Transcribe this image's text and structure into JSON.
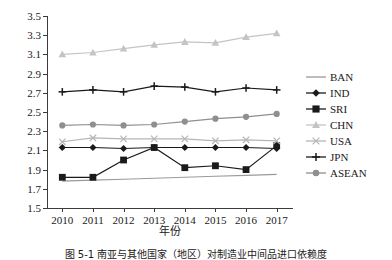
{
  "chart_data": {
    "type": "line",
    "title": "",
    "xlabel": "年份",
    "ylabel": "",
    "categories": [
      "2010",
      "2011",
      "2012",
      "2013",
      "2014",
      "2015",
      "2016",
      "2017"
    ],
    "x": [
      2010,
      2011,
      2012,
      2013,
      2014,
      2015,
      2016,
      2017
    ],
    "ylim": [
      1.5,
      3.5
    ],
    "yticks": [
      "1.5",
      "1.7",
      "1.9",
      "2.1",
      "2.3",
      "2.5",
      "2.7",
      "2.9",
      "3.1",
      "3.3",
      "3.5"
    ],
    "ytick_values": [
      1.5,
      1.7,
      1.9,
      2.1,
      2.3,
      2.5,
      2.7,
      2.9,
      3.1,
      3.3,
      3.5
    ],
    "grid": false,
    "legend_position": "right",
    "series": [
      {
        "name": "BAN",
        "marker": "none",
        "color": "#9a9a9a",
        "values": [
          1.78,
          1.79,
          1.8,
          1.81,
          1.82,
          1.83,
          1.84,
          1.85
        ]
      },
      {
        "name": "IND",
        "marker": "diamond",
        "color": "#1a1a1a",
        "values": [
          2.13,
          2.13,
          2.12,
          2.13,
          2.13,
          2.13,
          2.13,
          2.12
        ]
      },
      {
        "name": "SRI",
        "marker": "square",
        "color": "#1a1a1a",
        "values": [
          1.82,
          1.82,
          2.0,
          2.13,
          1.92,
          1.94,
          1.9,
          2.15
        ]
      },
      {
        "name": "CHN",
        "marker": "triangle",
        "color": "#c4c4c4",
        "values": [
          3.1,
          3.12,
          3.16,
          3.2,
          3.23,
          3.22,
          3.28,
          3.32
        ]
      },
      {
        "name": "USA",
        "marker": "cross-x",
        "color": "#b5b5b5",
        "values": [
          2.19,
          2.23,
          2.22,
          2.22,
          2.22,
          2.2,
          2.21,
          2.2
        ]
      },
      {
        "name": "JPN",
        "marker": "plus",
        "color": "#1a1a1a",
        "values": [
          2.71,
          2.73,
          2.71,
          2.77,
          2.76,
          2.71,
          2.75,
          2.73
        ]
      },
      {
        "name": "ASEAN",
        "marker": "circle",
        "color": "#8f8f8f",
        "values": [
          2.36,
          2.37,
          2.36,
          2.37,
          2.4,
          2.43,
          2.45,
          2.48
        ]
      }
    ]
  },
  "caption": "图 5-1  南亚与其他国家（地区）对制造业中间品进口依赖度"
}
